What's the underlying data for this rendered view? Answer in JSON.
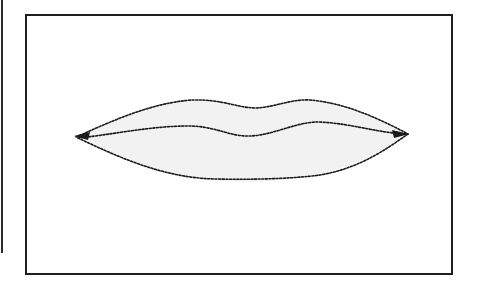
{
  "figure": {
    "stroke_color": "#1a1a1a",
    "shade_color": "#ececec"
  }
}
